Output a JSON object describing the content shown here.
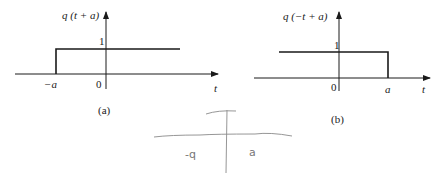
{
  "panels": [
    {
      "id": "a",
      "ylabel": "q (t + a)",
      "xlabel": "t",
      "level_label": "1",
      "origin_label": "0",
      "edge_label": "−a",
      "caption": "(a)"
    },
    {
      "id": "b",
      "ylabel": "q (−t + a)",
      "xlabel": "t",
      "level_label": "1",
      "origin_label": "0",
      "edge_label": "a",
      "caption": "(b)"
    }
  ],
  "handwritten": {
    "left_label": "-q",
    "right_label": "a"
  },
  "colors": {
    "ink": "#1a1a1a",
    "pencil": "#8a8a8a"
  }
}
